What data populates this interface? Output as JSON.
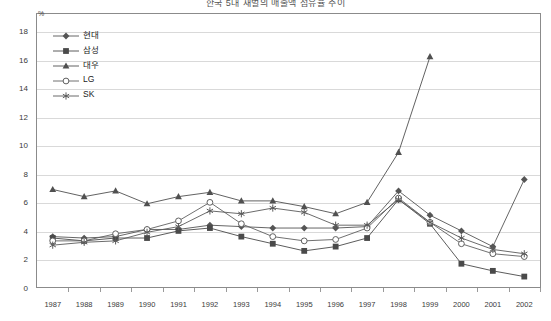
{
  "title": "한국 5대 재벌의 매출액 점유율 추이",
  "axis": {
    "y_unit_label": "%",
    "y_ticks": [
      0,
      2,
      4,
      6,
      8,
      10,
      12,
      14,
      16,
      18
    ],
    "x_ticks": [
      "1987",
      "1988",
      "1989",
      "1990",
      "1991",
      "1992",
      "1993",
      "1994",
      "1995",
      "1996",
      "1997",
      "1998",
      "1999",
      "2000",
      "2001",
      "2002"
    ]
  },
  "legend": {
    "position": "top-left-inside",
    "entries": [
      {
        "label": "현대",
        "marker": "filled-diamond",
        "color": "#555555"
      },
      {
        "label": "삼성",
        "marker": "filled-square",
        "color": "#4a4a4a"
      },
      {
        "label": "대우",
        "marker": "filled-triangle",
        "color": "#505050"
      },
      {
        "label": "LG",
        "marker": "open-circle",
        "color": "#606060"
      },
      {
        "label": "SK",
        "marker": "asterisk",
        "color": "#5a5a5a"
      }
    ]
  },
  "chart_data": {
    "type": "line",
    "title": "한국 5대 재벌의 매출액 점유율 추이",
    "xlabel": "",
    "ylabel": "%",
    "ylim": [
      0,
      18
    ],
    "grid": true,
    "legend_position": "top-left-inside",
    "categories": [
      "1987",
      "1988",
      "1989",
      "1990",
      "1991",
      "1992",
      "1993",
      "1994",
      "1995",
      "1996",
      "1997",
      "1998",
      "1999",
      "2000",
      "2001",
      "2002"
    ],
    "series": [
      {
        "name": "현대",
        "marker": "filled-diamond",
        "color": "#555555",
        "values": [
          3.6,
          3.5,
          3.6,
          4.1,
          4.1,
          4.4,
          4.3,
          4.2,
          4.2,
          4.2,
          4.3,
          6.8,
          5.1,
          4.0,
          2.9,
          7.6
        ]
      },
      {
        "name": "삼성",
        "marker": "filled-square",
        "color": "#4a4a4a",
        "values": [
          3.5,
          3.3,
          3.5,
          3.5,
          4.0,
          4.2,
          3.6,
          3.1,
          2.6,
          2.9,
          3.5,
          6.2,
          4.5,
          1.7,
          1.2,
          0.8
        ]
      },
      {
        "name": "대우",
        "marker": "filled-triangle",
        "color": "#505050",
        "values": [
          6.9,
          6.4,
          6.8,
          5.9,
          6.4,
          6.7,
          6.1,
          6.1,
          5.7,
          5.2,
          6.0,
          9.5,
          16.2,
          null,
          null,
          null
        ]
      },
      {
        "name": "LG",
        "marker": "open-circle",
        "color": "#606060",
        "values": [
          3.3,
          3.3,
          3.8,
          4.1,
          4.7,
          6.0,
          4.5,
          3.6,
          3.3,
          3.4,
          4.2,
          6.3,
          4.6,
          3.1,
          2.4,
          2.2
        ]
      },
      {
        "name": "SK",
        "marker": "asterisk",
        "color": "#5a5a5a",
        "values": [
          3.0,
          3.2,
          3.3,
          3.9,
          4.3,
          5.4,
          5.2,
          5.6,
          5.3,
          4.4,
          4.4,
          6.2,
          4.6,
          3.5,
          2.7,
          2.4
        ]
      }
    ]
  }
}
